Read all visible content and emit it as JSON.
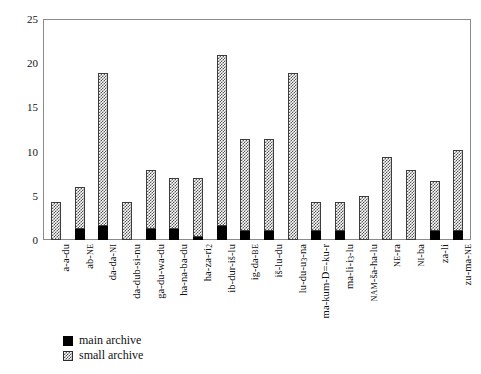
{
  "chart_data": {
    "type": "bar",
    "stacked": true,
    "title": "",
    "subtitle": "",
    "xlabel": "",
    "ylabel": "",
    "ylim": [
      0,
      25
    ],
    "yticks": [
      0,
      5,
      10,
      15,
      20,
      25
    ],
    "grid": false,
    "legend_position": "below-axis-left",
    "categories": [
      "a-a-du",
      "ab-NE",
      "da-da-NI",
      "da-dub-si-nu",
      "ga-du-wa-du",
      "ha-na-ba-du",
      "ha-za-ri2",
      "ib-dur-is-lu",
      "ig-da-BE",
      "is-lu-du",
      "lu-du-u3-na",
      "ma-kum-D=-ku-r",
      "ma-li-i3-lu",
      "NAM-sa-ha-lu",
      "NE-ra",
      "NI-ba",
      "za-li",
      "zu-ma-NE"
    ],
    "categories_display": [
      "a-a-du",
      "ab-<sc>NE</sc>",
      "da-da-<sc>NI</sc>",
      "da-dub-si-nu",
      "ga-du-wa-du",
      "ha-na-ba-du",
      "ha-za-ri<sub>2</sub>",
      "ib-dur-iš-lu",
      "ig-da-<sc>BE</sc>",
      "iš-lu-du",
      "lu-du-u<sub>3</sub>-na",
      "ma-kum-D=-ku-r",
      "ma-li-i<sub>3</sub>-lu",
      "<sc>NAM</sc>-ša-ha-lu",
      "<sc>NE</sc>-ra",
      "<sc>NI</sc>-ba",
      "za-li",
      "zu-ma-<sc>NE</sc>"
    ],
    "series": [
      {
        "name": "main archive",
        "color": "#000000",
        "pattern": "solid",
        "values": [
          0,
          1.2,
          1.6,
          0,
          1.2,
          1.2,
          0.3,
          1.6,
          1.0,
          1.0,
          0,
          1.0,
          1.0,
          0,
          0,
          0,
          1.0,
          1.0
        ]
      },
      {
        "name": "small archive",
        "color": "#555555",
        "pattern": "checkered",
        "values": [
          4.3,
          4.8,
          17.4,
          4.3,
          6.8,
          5.8,
          6.7,
          19.4,
          10.5,
          10.5,
          19.0,
          3.3,
          3.3,
          5.0,
          9.4,
          7.9,
          5.7,
          9.2
        ]
      }
    ],
    "totals": [
      4.3,
      6.0,
      19.0,
      4.3,
      8.0,
      7.0,
      7.0,
      21.0,
      11.5,
      11.5,
      19.0,
      4.3,
      4.3,
      5.0,
      9.4,
      7.9,
      6.7,
      10.2
    ]
  },
  "legend": {
    "items": [
      {
        "label": "main archive",
        "swatch": "solid-black-swatch"
      },
      {
        "label": "small archive",
        "swatch": "checkered-swatch"
      }
    ]
  }
}
